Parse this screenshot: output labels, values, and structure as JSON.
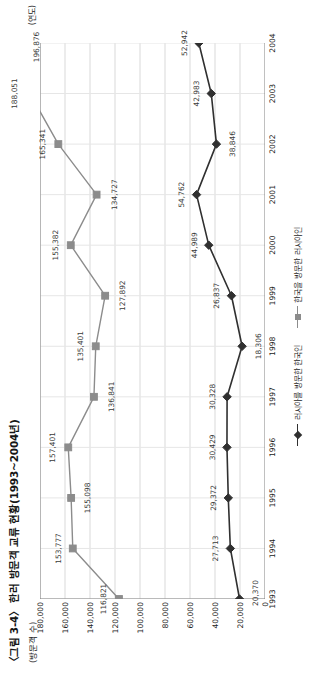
{
  "caption": "〈그림 3-4〉 한러 방문객 교류 현황(1993~2004년)",
  "axis_unit_y": "(방문객 수)",
  "axis_unit_x": "(연도)",
  "colors": {
    "series_russians_to_korea": "#8c8c8c",
    "series_koreans_to_russia": "#303030",
    "gridline": "#d9d9d9",
    "axis": "#808080",
    "text": "#2b2b2b"
  },
  "legend": {
    "position": "bottom-center",
    "items": [
      {
        "label": "러시아를 방문한 한국인",
        "marker": "diamond-marker",
        "color": "#303030"
      },
      {
        "label": "한국을 방문한 러시아인",
        "marker": "square-marker",
        "color": "#8c8c8c"
      }
    ]
  },
  "chart_data": {
    "type": "line",
    "title": "〈그림 3-4〉 한러 방문객 교류 현황(1993~2004년)",
    "xlabel": "(연도)",
    "ylabel": "(방문객 수)",
    "grid": true,
    "ylim": [
      0,
      180000
    ],
    "yticks": [
      0,
      20000,
      40000,
      60000,
      80000,
      100000,
      120000,
      140000,
      160000,
      180000
    ],
    "ytick_labels": [
      "0",
      "20,000",
      "40,000",
      "60,000",
      "80,000",
      "100,000",
      "120,000",
      "140,000",
      "160,000",
      "180,000"
    ],
    "categories": [
      "1993",
      "1994",
      "1995",
      "1996",
      "1997",
      "1998",
      "1999",
      "2000",
      "2001",
      "2002",
      "2003",
      "2004"
    ],
    "series": [
      {
        "name": "한국을 방문한 러시아인",
        "marker": "square",
        "color": "#8c8c8c",
        "values": [
          116821,
          153777,
          155098,
          157401,
          136841,
          135401,
          127892,
          155382,
          134727,
          165341,
          188051,
          196876
        ],
        "value_labels": [
          "116,821",
          "153,777",
          "155,098",
          "157,401",
          "136,841",
          "135,401",
          "127,892",
          "155,382",
          "134,727",
          "165,341",
          "188,051",
          "196,876"
        ]
      },
      {
        "name": "러시아를 방문한 한국인",
        "marker": "diamond",
        "color": "#303030",
        "values": [
          20370,
          27713,
          29372,
          30429,
          30328,
          18306,
          26837,
          44989,
          54762,
          38846,
          42983,
          52942
        ],
        "value_labels": [
          "20,370",
          "27,713",
          "29,372",
          "30,429",
          "30,328",
          "18,306",
          "26,837",
          "44,989",
          "54,762",
          "38,846",
          "42,983",
          "52,942"
        ]
      }
    ]
  }
}
